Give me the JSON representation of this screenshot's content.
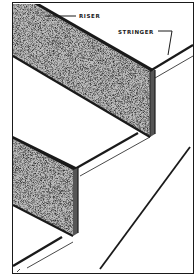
{
  "figure": {
    "type": "stair-construction-diagram",
    "labels": {
      "riser": "RISER",
      "stringer": "STRINGER"
    },
    "colors": {
      "ink": "#1a1a1a",
      "paper": "#ffffff",
      "riser_fill": "#6e6e6e"
    }
  }
}
